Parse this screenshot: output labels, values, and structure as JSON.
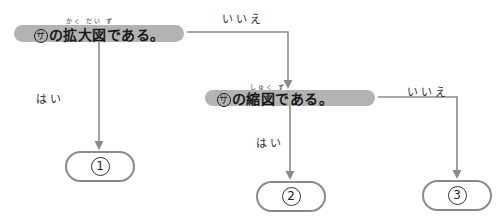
{
  "flowchart": {
    "line_color": "#8a8a8a",
    "pill_color": "#b3b3b3",
    "question1": {
      "symbol": "サ",
      "text": "の拡大図である。",
      "ruby": "かく だい  ず"
    },
    "question2": {
      "symbol": "サ",
      "text": "の縮図である。",
      "ruby": "しゅく  ず"
    },
    "labels": {
      "no1": "いいえ",
      "yes1": "はい",
      "no2": "いいえ",
      "yes2": "はい"
    },
    "results": [
      {
        "id": "1",
        "label": "①"
      },
      {
        "id": "2",
        "label": "②"
      },
      {
        "id": "3",
        "label": "③"
      }
    ]
  }
}
